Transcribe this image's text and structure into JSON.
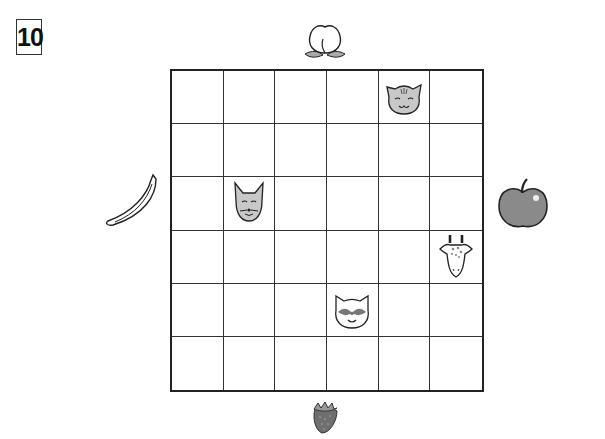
{
  "puzzle_number": "10",
  "grid": {
    "rows": 6,
    "cols": 6,
    "animals": [
      {
        "name": "cat",
        "row": 0,
        "col": 4
      },
      {
        "name": "fox",
        "row": 2,
        "col": 1
      },
      {
        "name": "giraffe",
        "row": 3,
        "col": 5
      },
      {
        "name": "raccoon",
        "row": 4,
        "col": 3
      }
    ]
  },
  "fruits": {
    "top": "peach",
    "left": "banana",
    "right": "apple",
    "bottom": "strawberry"
  },
  "colors": {
    "line": "#222222",
    "animal_fill": "#c8c8c8",
    "apple_fill": "#8a8a8a",
    "strawberry_fill": "#6f6f6f"
  }
}
